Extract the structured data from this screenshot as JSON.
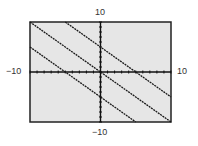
{
  "labels": {
    "ymax": "10",
    "ymin": "−10",
    "xmin": "−10",
    "xmax": "10"
  },
  "chart_data": {
    "type": "line",
    "title": "",
    "xlabel": "",
    "ylabel": "",
    "xlim": [
      -10,
      10
    ],
    "ylim": [
      -10,
      10
    ],
    "xscale_ticks": 1,
    "yscale_ticks": 1,
    "grid": false,
    "series": [
      {
        "name": "y = -x + 5",
        "x": [
          -5,
          10
        ],
        "y": [
          10,
          -5
        ]
      },
      {
        "name": "y = -x",
        "x": [
          -10,
          10
        ],
        "y": [
          10,
          -10
        ]
      },
      {
        "name": "y = -x - 5",
        "x": [
          -10,
          5
        ],
        "y": [
          5,
          -10
        ]
      }
    ],
    "background": "#e6e6e6",
    "line_color": "#1a1a1a"
  }
}
